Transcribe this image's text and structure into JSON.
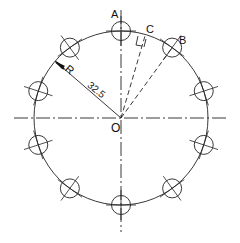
{
  "diagram": {
    "type": "bolt-circle technical drawing",
    "center_label": "O",
    "point_labels": {
      "a": "A",
      "b": "B",
      "c": "C"
    },
    "dimension": {
      "radius_prefix": "R",
      "radius_value": "32.5"
    },
    "hole_count": 10,
    "colors": {
      "line": "#222222",
      "background": "#ffffff"
    }
  }
}
